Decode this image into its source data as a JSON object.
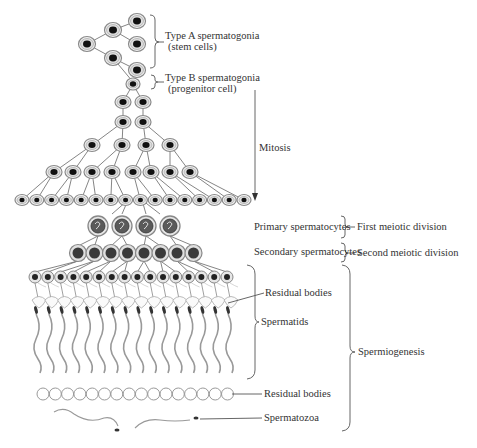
{
  "colors": {
    "line": "#555555",
    "cell_outline": "#8a8a8a",
    "cell_fill": "#e8e8e8",
    "nucleus": "#111111",
    "text": "#333333",
    "residual_outline": "#9a9a9a"
  },
  "labels": {
    "type_a": "Type A spermatogonia",
    "type_a_sub": "(stem cells)",
    "type_b": "Type B spermatogonia",
    "type_b_sub": "(progenitor cell)",
    "mitosis": "Mitosis",
    "primary": "Primary spermatocytes",
    "secondary": "Secondary spermatocytes",
    "first_meiotic": "First meiotic division",
    "second_meiotic": "Second meiotic division",
    "residual_bodies_1": "Residual bodies",
    "spermatids": "Spermatids",
    "spermiogenesis": "Spermiogenesis",
    "residual_bodies_2": "Residual bodies",
    "spermatozoa": "Spermatozoa"
  },
  "stages": [
    {
      "name": "Type A spermatogonia",
      "count": 5
    },
    {
      "name": "Type B spermatogonia",
      "count": 1
    },
    {
      "name": "Mitosis generation 1",
      "count": 2
    },
    {
      "name": "Mitosis generation 2",
      "count": 2
    },
    {
      "name": "Mitosis generation 3",
      "count": 4
    },
    {
      "name": "Mitosis generation 4",
      "count": 8
    },
    {
      "name": "Mitosis generation 5",
      "count": 16
    },
    {
      "name": "Primary spermatocytes",
      "count": 4
    },
    {
      "name": "Secondary spermatocytes",
      "count": 8
    },
    {
      "name": "Spermatids",
      "count": 16
    },
    {
      "name": "Residual bodies",
      "count": 16
    },
    {
      "name": "Spermatozoa",
      "count": 2
    }
  ]
}
